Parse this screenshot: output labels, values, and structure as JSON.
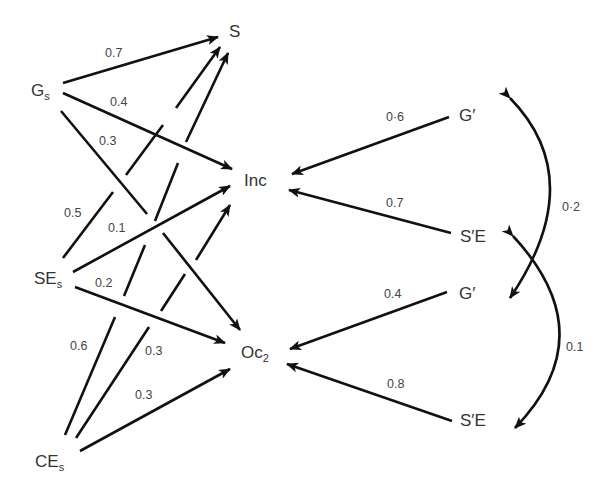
{
  "nodes": {
    "S": {
      "label": "S",
      "sub": ""
    },
    "Gs": {
      "label": "G",
      "sub": "s"
    },
    "Inc": {
      "label": "Inc",
      "sub": ""
    },
    "SEs": {
      "label": "SE",
      "sub": "s"
    },
    "Oc2": {
      "label": "Oc",
      "sub": "2"
    },
    "CEs": {
      "label": "CE",
      "sub": "s"
    },
    "G_prime_top": {
      "label": "G′",
      "sub": ""
    },
    "SE_prime_top": {
      "label": "S′E",
      "sub": ""
    },
    "G_prime_bottom": {
      "label": "G′",
      "sub": ""
    },
    "SE_prime_bottom": {
      "label": "S′E",
      "sub": ""
    }
  },
  "paths": [
    {
      "from": "Gs",
      "to": "S",
      "coef": "0.7"
    },
    {
      "from": "Gs",
      "to": "Inc",
      "coef": "0.4"
    },
    {
      "from": "Gs",
      "to": "Oc2",
      "coef": "0.3"
    },
    {
      "from": "SEs",
      "to": "S",
      "coef": "0.5"
    },
    {
      "from": "SEs",
      "to": "Inc",
      "coef": "0.1"
    },
    {
      "from": "SEs",
      "to": "Oc2",
      "coef": "0.2"
    },
    {
      "from": "CEs",
      "to": "S",
      "coef": "0.6"
    },
    {
      "from": "CEs",
      "to": "Inc",
      "coef": "0.3"
    },
    {
      "from": "CEs",
      "to": "Oc2",
      "coef": "0.3"
    },
    {
      "from": "G_prime_top",
      "to": "Inc",
      "coef": "0·6"
    },
    {
      "from": "SE_prime_top",
      "to": "Inc",
      "coef": "0.7"
    },
    {
      "from": "G_prime_bottom",
      "to": "Oc2",
      "coef": "0.4"
    },
    {
      "from": "SE_prime_bottom",
      "to": "Oc2",
      "coef": "0.8"
    }
  ],
  "correlations": [
    {
      "between": [
        "G_prime_top",
        "G_prime_bottom"
      ],
      "coef": "0·2"
    },
    {
      "between": [
        "SE_prime_top",
        "SE_prime_bottom"
      ],
      "coef": "0.1"
    }
  ],
  "colors": {
    "line": "#111111",
    "text": "#333333",
    "background": "#ffffff"
  }
}
